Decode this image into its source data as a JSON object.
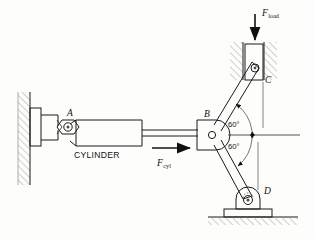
{
  "figure": {
    "type": "engineering-mechanism-diagram",
    "background_color": "#fdfdfc",
    "line_color": "#1a1a1a",
    "hatch_color": "#8a8a8a"
  },
  "labels": {
    "joint_a": "A",
    "joint_b": "B",
    "joint_c": "C",
    "joint_d": "D",
    "cylinder": "CYLINDER",
    "force_cyl_symbol": "F",
    "force_cyl_subscript": "cyl",
    "force_load_symbol": "F",
    "force_load_subscript": "load",
    "angle_upper": "60°",
    "angle_lower": "60°"
  },
  "geometry": {
    "points": {
      "A": {
        "x": 63,
        "y": 133
      },
      "B": {
        "x": 214,
        "y": 135
      },
      "C": {
        "x": 258,
        "y": 68
      },
      "D": {
        "x": 249,
        "y": 199
      }
    },
    "angles": {
      "bc_above_horizontal_deg": 60,
      "bd_below_horizontal_deg": 60,
      "included_cbd_deg": 120
    },
    "horizontal_reference": {
      "x_start": 214,
      "x_end": 300,
      "y": 135
    }
  },
  "components": {
    "wall": {
      "name": "fixed-wall-support",
      "x": 18,
      "y": 92,
      "width": 12,
      "height": 93,
      "hatched": true
    },
    "wall_bracket": {
      "name": "wall-bracket",
      "x": 30,
      "y": 108,
      "width": 10,
      "height": 38
    },
    "cylinder_barrel": {
      "name": "cylinder-barrel",
      "x": 76,
      "y": 120,
      "width": 66,
      "height": 24
    },
    "cylinder_rod": {
      "name": "cylinder-rod",
      "x_start": 142,
      "x_end": 196,
      "y": 133,
      "thickness": 6
    },
    "pin_a": {
      "name": "clevis-pin-joint-a",
      "shape": "hexagon-with-circle"
    },
    "pin_b": {
      "name": "pivot-joint-b",
      "shape": "rounded-block-with-circle"
    },
    "slider_c": {
      "name": "slider-block-c",
      "x": 245,
      "y": 45,
      "width": 17,
      "height": 34,
      "in_guides": true
    },
    "guide_rails": {
      "name": "vertical-guide-rails",
      "hatched": true
    },
    "support_d": {
      "name": "pinned-ground-support-d",
      "shape": "rounded-bearing-on-base-plate"
    },
    "ground": {
      "name": "ground-line",
      "y": 216,
      "x_start": 208,
      "x_end": 298,
      "hatched": true
    }
  },
  "forces": [
    {
      "name": "F_cyl",
      "direction": "right",
      "applied_at": "cylinder rod / joint B",
      "arrow": {
        "x_start": 152,
        "x_end": 192,
        "y": 148
      }
    },
    {
      "name": "F_load",
      "direction": "down",
      "applied_at": "slider block C",
      "arrow": {
        "x": 255,
        "y_start": 16,
        "y_end": 44
      }
    }
  ]
}
